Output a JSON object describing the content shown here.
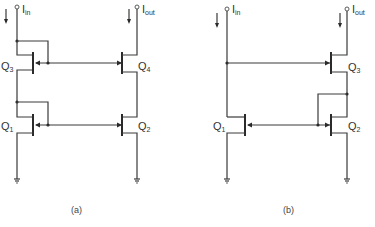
{
  "figure": {
    "panels": [
      {
        "id": "a",
        "caption": "(a)",
        "input_label": {
          "main": "I",
          "sub": "in"
        },
        "output_label": {
          "main": "I",
          "sub": "out"
        },
        "transistors": [
          {
            "name": "Q",
            "sub": "3",
            "side": "left",
            "position": "top"
          },
          {
            "name": "Q",
            "sub": "4",
            "side": "right",
            "position": "top"
          },
          {
            "name": "Q",
            "sub": "1",
            "side": "left",
            "position": "bottom"
          },
          {
            "name": "Q",
            "sub": "2",
            "side": "right",
            "position": "bottom"
          }
        ]
      },
      {
        "id": "b",
        "caption": "(b)",
        "input_label": {
          "main": "I",
          "sub": "in"
        },
        "output_label": {
          "main": "I",
          "sub": "out"
        },
        "transistors": [
          {
            "name": "Q",
            "sub": "3",
            "side": "right",
            "position": "top"
          },
          {
            "name": "Q",
            "sub": "1",
            "side": "left",
            "position": "bottom"
          },
          {
            "name": "Q",
            "sub": "2",
            "side": "right",
            "position": "bottom"
          }
        ]
      }
    ],
    "colors": {
      "line": "#3a3a3a",
      "text": "#333333",
      "background": "#ffffff"
    }
  }
}
